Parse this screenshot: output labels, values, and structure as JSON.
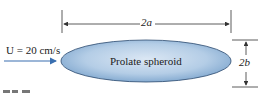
{
  "figure": {
    "body_label": "Prolate spheroid",
    "flow_label": "U = 20 cm/s",
    "length_label": "2a",
    "height_label": "2b",
    "colors": {
      "body_fill_light": "#d3e2f1",
      "body_fill_dark": "#7aa3cc",
      "body_stroke": "#2c4a6e",
      "arrow": "#3a6fb0",
      "dim_lines": "#333333"
    }
  }
}
